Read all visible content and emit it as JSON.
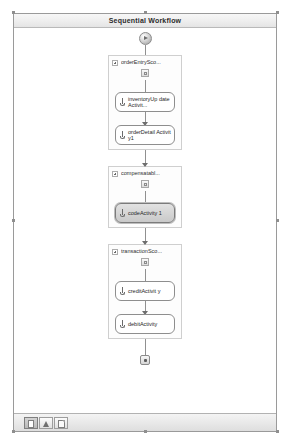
{
  "window": {
    "title": "Sequential Workflow"
  },
  "canvas": {
    "start_node": "start-node",
    "end_node": "end-node"
  },
  "flow": [
    {
      "kind": "scope",
      "name": "order-entry-scope",
      "label": "orderEntrySco...",
      "badge": "scope-icon",
      "children": [
        {
          "kind": "activity",
          "name": "inventory-update-activity",
          "label": "inventoryUp dateActivit...",
          "selected": false
        },
        {
          "kind": "activity",
          "name": "order-detail-activity",
          "label": "orderDetail Activity1",
          "selected": false
        }
      ]
    },
    {
      "kind": "scope",
      "name": "compensatable-scope",
      "label": "compensatabl...",
      "badge": "scope-icon",
      "children": [
        {
          "kind": "activity",
          "name": "code-activity",
          "label": "codeActivity 1",
          "selected": true
        }
      ]
    },
    {
      "kind": "scope",
      "name": "transaction-scope",
      "label": "transactionSco...",
      "badge": "scope-icon",
      "children": [
        {
          "kind": "activity",
          "name": "credit-activity",
          "label": "creditActivit y",
          "selected": false
        },
        {
          "kind": "activity",
          "name": "debit-activity",
          "label": "debitActivity",
          "selected": false
        }
      ]
    }
  ],
  "toolbar": {
    "buttons": [
      {
        "name": "view-designer-button",
        "glyph": "page-icon",
        "active": true
      },
      {
        "name": "validate-button",
        "glyph": "triangle-icon",
        "active": false
      },
      {
        "name": "view-code-button",
        "glyph": "sheet-icon",
        "active": false
      }
    ]
  },
  "colors": {
    "frame": "#9a9a9a",
    "title_text": "#2b2b2b",
    "connector": "#909090",
    "activity_border": "#8e8e8e",
    "scope_border": "#cfcfcf",
    "selected_fill": "#d6d6d6"
  }
}
